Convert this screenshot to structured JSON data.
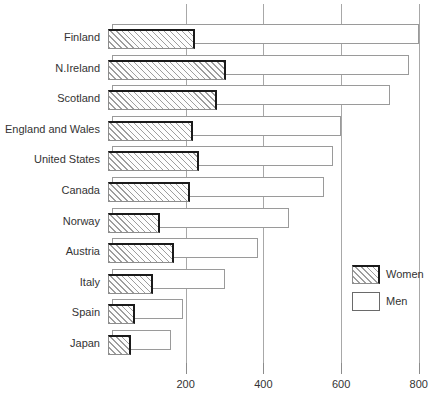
{
  "chart_data": {
    "type": "bar",
    "orientation": "horizontal",
    "title": "",
    "subtitle": "",
    "xlabel": "",
    "ylabel": "",
    "grid": true,
    "xlim": [
      0,
      830
    ],
    "xticks": [
      200,
      400,
      600,
      800
    ],
    "xtick_labels": [
      "200",
      "400",
      "600",
      "800"
    ],
    "legend_position": "right-middle",
    "categories": [
      "Finland",
      "N.Ireland",
      "Scotland",
      "England and Wales",
      "United States",
      "Canada",
      "Norway",
      "Austria",
      "Italy",
      "Spain",
      "Japan"
    ],
    "series": [
      {
        "name": "Men",
        "style": "white",
        "values": [
          790,
          765,
          715,
          590,
          570,
          545,
          455,
          375,
          290,
          182,
          152
        ]
      },
      {
        "name": "Women",
        "style": "hatched",
        "values": [
          225,
          305,
          280,
          220,
          235,
          210,
          135,
          170,
          115,
          70,
          58
        ]
      }
    ]
  },
  "legend": {
    "items": [
      {
        "label": "Women",
        "swatch": "hatched"
      },
      {
        "label": "Men",
        "swatch": "white"
      }
    ]
  },
  "colors": {
    "hatch_line": "#9d9d9d",
    "bar_edge_dark": "#1a1a1a",
    "bar_edge_light": "#9a9a9a",
    "gridline": "#a8a8a8",
    "text": "#333333",
    "background": "#ffffff"
  }
}
